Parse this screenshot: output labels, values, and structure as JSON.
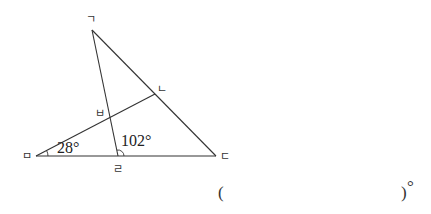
{
  "diagram": {
    "points": {
      "g": {
        "label": "ㄱ",
        "x": 92,
        "y": 30
      },
      "n": {
        "label": "ㄴ",
        "x": 155,
        "y": 94
      },
      "d": {
        "label": "ㄷ",
        "x": 216,
        "y": 156
      },
      "r": {
        "label": "ㄹ",
        "x": 118,
        "y": 156
      },
      "m": {
        "label": "ㅁ",
        "x": 36,
        "y": 156
      },
      "b": {
        "label": "ㅂ",
        "x": 110,
        "y": 117
      }
    },
    "angles": {
      "angle_m": "28°",
      "angle_r": "102°"
    }
  },
  "answer": {
    "open_paren": "(",
    "close_paren": ")",
    "unit": "°"
  }
}
